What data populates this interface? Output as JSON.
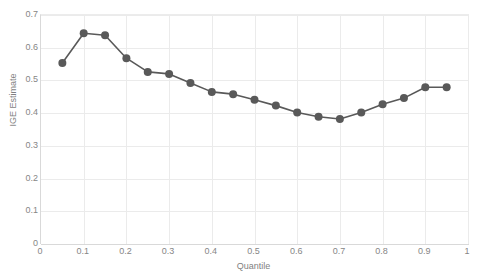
{
  "chart_data": {
    "type": "line",
    "title": "",
    "xlabel": "Quantile",
    "ylabel": "IGE Estimate",
    "xlim": [
      0,
      1
    ],
    "ylim": [
      0,
      0.7
    ],
    "grid": true,
    "legend": "none",
    "x_ticks": [
      "0",
      "0.1",
      "0.2",
      "0.3",
      "0.4",
      "0.5",
      "0.6",
      "0.7",
      "0.8",
      "0.9",
      "1"
    ],
    "x_tick_values": [
      0,
      0.1,
      0.2,
      0.3,
      0.4,
      0.5,
      0.6,
      0.7,
      0.8,
      0.9,
      1
    ],
    "y_ticks": [
      "0",
      "0.1",
      "0.2",
      "0.3",
      "0.4",
      "0.5",
      "0.6",
      "0.7"
    ],
    "y_tick_values": [
      0,
      0.1,
      0.2,
      0.3,
      0.4,
      0.5,
      0.6,
      0.7
    ],
    "x": [
      0.05,
      0.1,
      0.15,
      0.2,
      0.25,
      0.3,
      0.35,
      0.4,
      0.45,
      0.5,
      0.55,
      0.6,
      0.65,
      0.7,
      0.75,
      0.8,
      0.85,
      0.9,
      0.95
    ],
    "values": [
      0.553,
      0.644,
      0.638,
      0.568,
      0.526,
      0.52,
      0.492,
      0.465,
      0.458,
      0.441,
      0.423,
      0.402,
      0.389,
      0.382,
      0.402,
      0.427,
      0.446,
      0.479,
      0.479
    ],
    "series": [
      {
        "name": "IGE Estimate",
        "values": [
          0.553,
          0.644,
          0.638,
          0.568,
          0.526,
          0.52,
          0.492,
          0.465,
          0.458,
          0.441,
          0.423,
          0.402,
          0.389,
          0.382,
          0.402,
          0.427,
          0.446,
          0.479,
          0.479
        ]
      }
    ],
    "colors": {
      "series_line": "#595959",
      "marker": "#595959",
      "gridline": "#ebebeb",
      "axis": "#d9d9d9",
      "tick_label": "#868686",
      "axis_title": "#7f7f7f",
      "background": "#ffffff"
    },
    "marker": "circle",
    "marker_size": 4,
    "line_width": 1.6
  }
}
